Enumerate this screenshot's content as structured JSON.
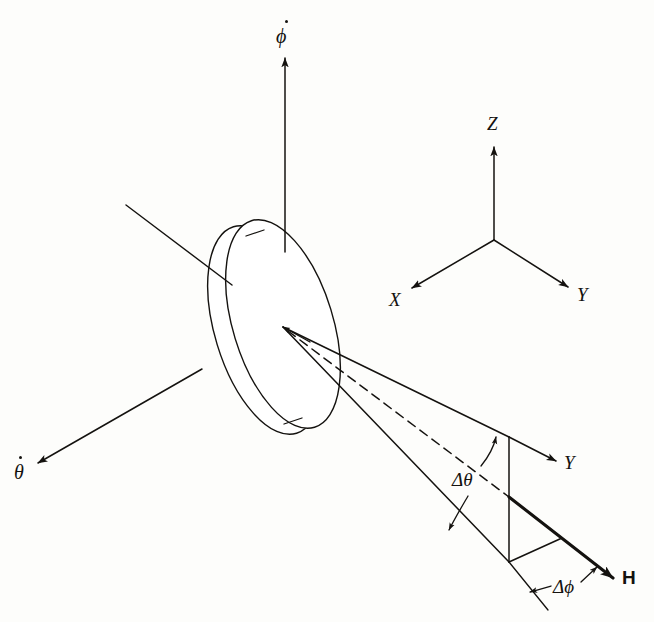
{
  "figure": {
    "background_color": "#fdfdfb",
    "ink_color": "#14120f"
  },
  "rotor": {
    "name": "spinning disk rotor",
    "shape": "tilted ellipse with visible rim thickness"
  },
  "rate_vectors": {
    "phi_dot": {
      "label": "ϕ",
      "overdot": true,
      "description": "precession rate vector, vertical, pointing up"
    },
    "theta_dot": {
      "label": "θ",
      "overdot": true,
      "description": "nutation rate vector, pointing down-left"
    },
    "spin_axis": {
      "label": "",
      "description": "spin axis line through rotor, upper-left, no arrowhead"
    }
  },
  "reference_triad": {
    "name": "XYZ reference frame",
    "axes": [
      {
        "label": "Z",
        "direction": "up"
      },
      {
        "label": "X",
        "direction": "down-left"
      },
      {
        "label": "Y",
        "direction": "down-right"
      }
    ]
  },
  "momentum_cone": {
    "name": "angular momentum change cone",
    "apex_label": "",
    "centerline_style": "dashed",
    "vectors": [
      {
        "label": "Y",
        "style": "thin arrow",
        "description": "Y axis at cone base"
      },
      {
        "label": "H",
        "style": "bold arrow",
        "description": "angular momentum vector"
      }
    ],
    "angles": [
      {
        "label": "Δθ",
        "description": "nutation angle increment between dashed centerline and lower cone edge"
      },
      {
        "label": "Δϕ",
        "description": "precession angle increment at the cone base"
      }
    ]
  },
  "labels": {
    "phi_dot": "ϕ",
    "theta_dot": "θ",
    "axis_z": "Z",
    "axis_x": "X",
    "axis_y": "Y",
    "cone_y": "Y",
    "vector_h": "H",
    "delta_theta": "Δθ",
    "delta_phi": "Δϕ"
  }
}
